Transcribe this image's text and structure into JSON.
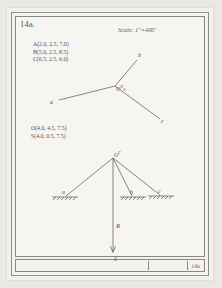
{
  "sheet": {
    "figure_number": "14a.",
    "sheet_number": "14a",
    "scale_note": "Scale: 1\"=400'"
  },
  "coordinates": {
    "top_block": [
      "A(2.0, 2.5, 7.0)",
      "B(5.0, 2.5, 8.5)",
      "C(6.5, 2.5, 6.0)"
    ],
    "bottom_block": [
      "O(4.0, 4.5, 7.5)",
      "S(4.0, 0.5, 7.5)"
    ]
  },
  "plan_view": {
    "name": "plan-view-tripod",
    "center_label": "O",
    "center_sup": "H",
    "center_sub": "S",
    "leg_labels": {
      "a": "a",
      "b": "b",
      "c": "c"
    }
  },
  "elevation_view": {
    "name": "elevation-view-tripod",
    "apex_label": "O",
    "apex_sup": "F",
    "support_labels": {
      "a": "a",
      "b": "b",
      "c": "c"
    },
    "load_label": "R",
    "load_point_label": "S"
  },
  "colors": {
    "paper": "#f6f5f2",
    "ink": "#55544f",
    "border": "#8a8883"
  }
}
